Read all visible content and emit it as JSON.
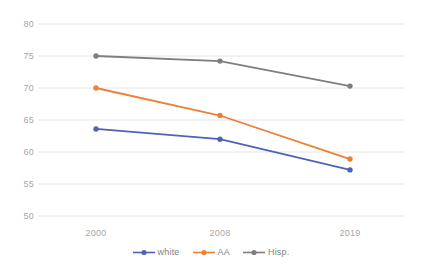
{
  "chart_data": {
    "type": "line",
    "title": "",
    "xlabel": "",
    "ylabel": "",
    "categories": [
      "2000",
      "2008",
      "2019"
    ],
    "x_tick_labels": [
      "2000",
      "2008",
      "2019"
    ],
    "y_tick_labels": [
      "50",
      "55",
      "60",
      "65",
      "70",
      "75",
      "80"
    ],
    "ylim": [
      48,
      81
    ],
    "y_ticks": [
      50,
      55,
      60,
      65,
      70,
      75,
      80
    ],
    "grid": true,
    "grid_axis": "y",
    "legend_position": "bottom-center",
    "series": [
      {
        "name": "white",
        "color": "#4f62b5",
        "marker": "circle",
        "values": [
          63.6,
          62.0,
          57.2
        ]
      },
      {
        "name": "AA",
        "color": "#ed8034",
        "marker": "circle",
        "values": [
          70.0,
          65.7,
          58.9
        ]
      },
      {
        "name": "Hisp.",
        "color": "#7e7e7e",
        "marker": "circle",
        "values": [
          75.0,
          74.2,
          70.3
        ]
      }
    ]
  },
  "axis": {
    "y_labels": [
      "80",
      "75",
      "70",
      "65",
      "60",
      "55",
      "50"
    ],
    "x_labels": [
      "2000",
      "2008",
      "2019"
    ]
  },
  "legend": {
    "items": [
      {
        "label": "white",
        "color": "#4f62b5"
      },
      {
        "label": "AA",
        "color": "#ed8034"
      },
      {
        "label": "Hisp.",
        "color": "#7e7e7e"
      }
    ]
  },
  "colors": {
    "grid": "#e4e4e4",
    "axis_text": "#a6a6a6",
    "legend_text": "#7f7f7f",
    "background": "#ffffff",
    "series_white": "#4f62b5",
    "series_aa": "#ed8034",
    "series_hisp": "#7e7e7e"
  }
}
